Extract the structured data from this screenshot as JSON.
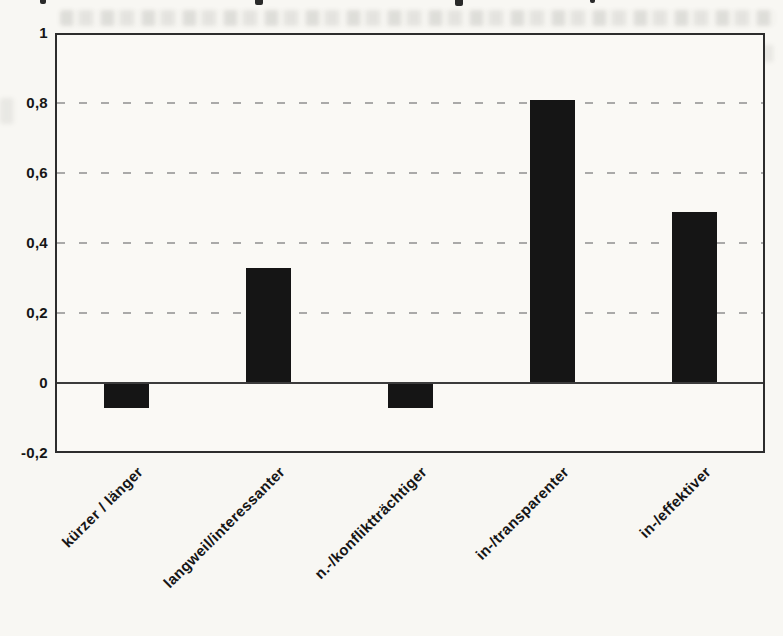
{
  "page": {
    "background_color": "#f8f7f3",
    "description_note": "scanned page with a single black bar chart"
  },
  "chart_data": {
    "type": "bar",
    "title": "",
    "xlabel": "",
    "ylabel": "",
    "categories": [
      "kürzer / länger",
      "langweil/interessanter",
      "n.-/konfliktträchtiger",
      "in-/transparenter",
      "in-/effektiver"
    ],
    "values": [
      -0.07,
      0.33,
      -0.07,
      0.81,
      0.49
    ],
    "ylim": [
      -0.2,
      1
    ],
    "yticks": [
      {
        "value": 1,
        "label": "1"
      },
      {
        "value": 0.8,
        "label": "0,8"
      },
      {
        "value": 0.6,
        "label": "0,6"
      },
      {
        "value": 0.4,
        "label": "0,4"
      },
      {
        "value": 0.2,
        "label": "0,2"
      },
      {
        "value": 0,
        "label": "0"
      },
      {
        "value": -0.2,
        "label": "-0,2"
      }
    ],
    "decimal_separator": ",",
    "grid": "horizontal dashed gridlines at 0,2 steps",
    "zero_line": "solid",
    "legend_position": "none",
    "bar_color": "#151515",
    "frame_color": "#2d2d2d",
    "gridline_color": "#8f8f8f",
    "x_label_rotation_deg": -45
  }
}
